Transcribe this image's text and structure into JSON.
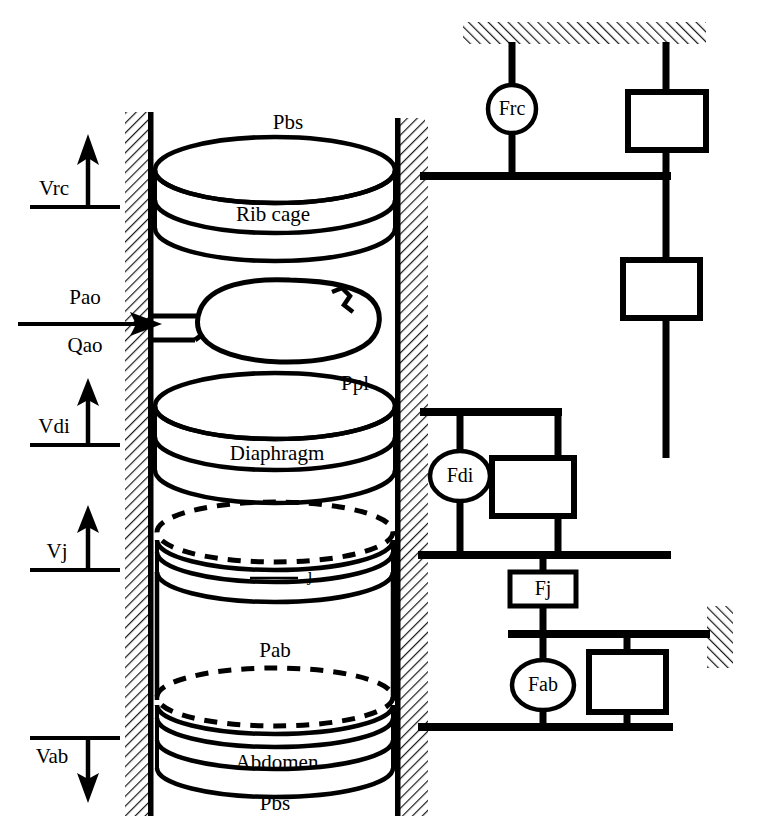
{
  "figure": {
    "ink_color": "#000000",
    "background_color": "#ffffff"
  },
  "anatomical_model": {
    "labels": {
      "pressure_body_surface_top": "Pbs",
      "rib_cage": "Rib cage",
      "pressure_airway_opening": "Pao",
      "flow_airway_opening": "Qao",
      "pressure_pleural": "Ppl",
      "diaphragm": "Diaphragm",
      "junction": "j",
      "pressure_abdominal": "Pab",
      "abdomen": "Abdomen",
      "pressure_body_surface_bottom": "Pbs"
    },
    "volume_markers": [
      {
        "id": "vrc",
        "label": "Vrc",
        "direction": "up"
      },
      {
        "id": "vdi",
        "label": "Vdi",
        "direction": "up"
      },
      {
        "id": "vj",
        "label": "Vj",
        "direction": "up"
      },
      {
        "id": "vab",
        "label": "Vab",
        "direction": "down"
      }
    ],
    "input_arrow": {
      "pressure_label": "Pao",
      "flow_label": "Qao",
      "direction": "right"
    }
  },
  "mechanical_analog": {
    "force_generators": [
      {
        "id": "frc",
        "label": "Frc",
        "shape": "circle"
      },
      {
        "id": "fdi",
        "label": "Fdi",
        "shape": "ellipse"
      },
      {
        "id": "fj",
        "label": "Fj",
        "shape": "rectangle"
      },
      {
        "id": "fab",
        "label": "Fab",
        "shape": "ellipse"
      }
    ],
    "elements": [
      {
        "id": "rc-element",
        "shape": "rectangle",
        "label": ""
      },
      {
        "id": "lung-element",
        "shape": "rectangle",
        "label": ""
      },
      {
        "id": "di-element",
        "shape": "rectangle",
        "label": ""
      },
      {
        "id": "ab-element",
        "shape": "rectangle",
        "label": ""
      }
    ],
    "ground_supports": [
      {
        "id": "ground-top",
        "orientation": "horizontal"
      },
      {
        "id": "ground-left",
        "orientation": "vertical"
      },
      {
        "id": "ground-right-mid",
        "orientation": "vertical"
      }
    ]
  },
  "walls": [
    {
      "id": "wall-left",
      "orientation": "vertical",
      "hatched": true
    },
    {
      "id": "wall-right",
      "orientation": "vertical",
      "hatched": true
    }
  ]
}
